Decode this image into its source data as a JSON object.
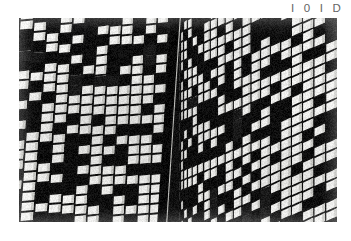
{
  "figure": {
    "label": "I 0 I D",
    "label_color": "#646464"
  },
  "photo": {
    "name": "building-facade-photograph",
    "description": "High-contrast black and white photograph of a modernist high-rise facade, steep upward perspective, grid of rectangular windows alternating lit (white) and dark (black).",
    "frame": {
      "x": 19,
      "y": 18,
      "width": 318,
      "height": 204
    },
    "palette": {
      "window_light": "#f4f4f2",
      "window_light_shadow": "#cfcfcb",
      "window_dark": "#0d0d0d",
      "mullion": "#111111",
      "spandrel": "#1a1a1a",
      "seam": "#080808",
      "paper": "#ffffff"
    },
    "facades": [
      {
        "name": "left-facade",
        "x_start": 0,
        "x_end": 152,
        "column_count": 13,
        "row_count": 26,
        "column_skew_deg": -7,
        "row_pitch_px": 7.6,
        "note": "Columns lean left toward the bottom; rows converge slightly toward the corner seam."
      },
      {
        "name": "corner-seam",
        "x_start": 148,
        "x_end": 160,
        "note": "Dark vertical building corner, tilted about 3 degrees, separating the two facade planes."
      },
      {
        "name": "right-facade",
        "x_start": 160,
        "x_end": 318,
        "column_count": 22,
        "row_count": 30,
        "column_skew_deg": 26,
        "row_pitch_px": 6.4,
        "note": "Strongly raked diagonal bands receding to the right; window bands compress toward the right edge."
      }
    ],
    "lit_window_fraction": 0.62
  }
}
